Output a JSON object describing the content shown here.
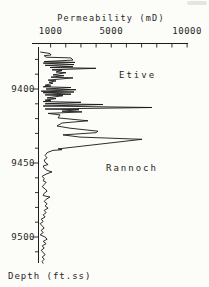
{
  "chart_data": {
    "type": "line",
    "title": "Permeability (mD)",
    "xlabel": "Permeability (mD)",
    "ylabel": "Depth (ft.ss)",
    "x_axis": {
      "position": "top",
      "scale": "linear",
      "unit": "mD",
      "labeled_ticks": [
        {
          "value": 1000,
          "label": "1000"
        },
        {
          "value": 5000,
          "label": "5000"
        },
        {
          "value": 10000,
          "label": "10000"
        }
      ],
      "tick_values": [
        1000,
        2000,
        3000,
        4000,
        5000,
        6000,
        7000,
        8000,
        9000,
        10000
      ],
      "range": [
        -250,
        10050
      ]
    },
    "y_axis": {
      "position": "left",
      "direction": "increasing-down",
      "unit": "ft.ss",
      "labeled_ticks": [
        {
          "value": 9400,
          "label": "9400"
        },
        {
          "value": 9450,
          "label": "9450"
        },
        {
          "value": 9500,
          "label": "9500"
        }
      ],
      "tick_values": [
        9380,
        9390,
        9400,
        9410,
        9420,
        9430,
        9440,
        9450,
        9460,
        9470,
        9480,
        9490,
        9500,
        9510
      ],
      "range": [
        9372,
        9518
      ]
    },
    "annotations": [
      {
        "text": "Etive"
      },
      {
        "text": "Rannoch"
      }
    ],
    "series": [
      {
        "name": "permeability",
        "points": [
          [
            315,
            9375
          ],
          [
            960,
            9376
          ],
          [
            1025,
            9377
          ],
          [
            575,
            9377.5
          ],
          [
            705,
            9378.5
          ],
          [
            2345,
            9379
          ],
          [
            2475,
            9380.5
          ],
          [
            575,
            9381.5
          ],
          [
            2610,
            9382
          ],
          [
            510,
            9382.5
          ],
          [
            2540,
            9383.5
          ],
          [
            640,
            9384
          ],
          [
            2475,
            9385
          ],
          [
            960,
            9385.5
          ],
          [
            3990,
            9386
          ],
          [
            1090,
            9387
          ],
          [
            1750,
            9387.5
          ],
          [
            1355,
            9388.5
          ],
          [
            2015,
            9389
          ],
          [
            1160,
            9390.5
          ],
          [
            1880,
            9391
          ],
          [
            1025,
            9392
          ],
          [
            2475,
            9392.5
          ],
          [
            835,
            9394
          ],
          [
            1355,
            9394.5
          ],
          [
            900,
            9395.5
          ],
          [
            1160,
            9396
          ],
          [
            640,
            9397.5
          ],
          [
            1025,
            9398
          ],
          [
            510,
            9398.5
          ],
          [
            2345,
            9399
          ],
          [
            705,
            9400
          ],
          [
            2675,
            9400.5
          ],
          [
            380,
            9401.5
          ],
          [
            2540,
            9402
          ],
          [
            510,
            9402.5
          ],
          [
            2345,
            9403.5
          ],
          [
            640,
            9404
          ],
          [
            1815,
            9404.5
          ],
          [
            770,
            9406
          ],
          [
            1355,
            9406.5
          ],
          [
            640,
            9407.5
          ],
          [
            1025,
            9408
          ],
          [
            510,
            9408.5
          ],
          [
            3005,
            9409
          ],
          [
            640,
            9410
          ],
          [
            4455,
            9410.5
          ],
          [
            510,
            9411.5
          ],
          [
            7685,
            9412.5
          ],
          [
            640,
            9413.5
          ],
          [
            2870,
            9414
          ],
          [
            1750,
            9415
          ],
          [
            3070,
            9415.5
          ],
          [
            835,
            9416.5
          ],
          [
            1620,
            9417.5
          ],
          [
            1490,
            9419.5
          ],
          [
            3465,
            9421.5
          ],
          [
            1750,
            9423
          ],
          [
            1420,
            9425
          ],
          [
            2280,
            9426.5
          ],
          [
            4125,
            9428.5
          ],
          [
            3990,
            9429.5
          ],
          [
            1815,
            9431
          ],
          [
            2940,
            9432.5
          ],
          [
            7025,
            9434
          ],
          [
            1490,
            9440.5
          ],
          [
            1750,
            9441
          ],
          [
            1160,
            9441.5
          ],
          [
            770,
            9443
          ],
          [
            640,
            9445
          ],
          [
            770,
            9446.5
          ],
          [
            575,
            9448
          ],
          [
            640,
            9449.5
          ],
          [
            835,
            9451
          ],
          [
            510,
            9452
          ],
          [
            575,
            9453.5
          ],
          [
            770,
            9455
          ],
          [
            1090,
            9456
          ],
          [
            705,
            9457.5
          ],
          [
            445,
            9459
          ],
          [
            575,
            9460.5
          ],
          [
            510,
            9462
          ],
          [
            705,
            9463
          ],
          [
            575,
            9464.5
          ],
          [
            445,
            9466
          ],
          [
            640,
            9467.5
          ],
          [
            770,
            9469
          ],
          [
            575,
            9470.5
          ],
          [
            510,
            9472
          ],
          [
            960,
            9473
          ],
          [
            705,
            9474.5
          ],
          [
            575,
            9476
          ],
          [
            770,
            9477.5
          ],
          [
            640,
            9479
          ],
          [
            835,
            9480.5
          ],
          [
            575,
            9482
          ],
          [
            705,
            9483.5
          ],
          [
            510,
            9485
          ],
          [
            640,
            9486.5
          ],
          [
            380,
            9488
          ],
          [
            510,
            9489.5
          ],
          [
            315,
            9491
          ],
          [
            445,
            9492.5
          ],
          [
            575,
            9494
          ],
          [
            380,
            9495.5
          ],
          [
            510,
            9497
          ],
          [
            315,
            9498.5
          ],
          [
            640,
            9500
          ],
          [
            770,
            9501.5
          ],
          [
            510,
            9503
          ],
          [
            705,
            9504.5
          ],
          [
            445,
            9506
          ],
          [
            575,
            9507.5
          ],
          [
            380,
            9509
          ],
          [
            510,
            9510.5
          ],
          [
            640,
            9512
          ],
          [
            445,
            9513.5
          ],
          [
            575,
            9515
          ],
          [
            445,
            9516.5
          ],
          [
            510,
            9518
          ]
        ]
      }
    ]
  }
}
